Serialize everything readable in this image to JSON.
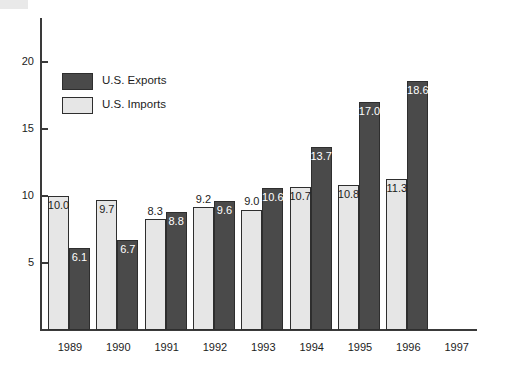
{
  "chart_data": {
    "type": "bar",
    "title": "",
    "subtitle": "",
    "xlabel": "",
    "ylabel": "",
    "categories": [
      "1989",
      "1990",
      "1991",
      "1992",
      "1993",
      "1994",
      "1995",
      "1996",
      "1997"
    ],
    "series": [
      {
        "name": "U.S. Imports",
        "color": "#e6e6e6",
        "values": [
          10.0,
          9.7,
          8.3,
          9.2,
          9.0,
          10.7,
          10.8,
          11.3,
          null
        ],
        "labels": [
          "10.0",
          "9.7",
          "8.3",
          "9.2",
          "9.0",
          "10.7",
          "10.8",
          "11.3",
          ""
        ]
      },
      {
        "name": "U.S. Exports",
        "color": "#4a4a4a",
        "values": [
          6.1,
          6.7,
          8.8,
          9.6,
          10.6,
          13.7,
          17.0,
          18.6,
          null
        ],
        "labels": [
          "6.1",
          "6.7",
          "8.8",
          "9.6",
          "10.6",
          "13.7",
          "17.0",
          "18.6",
          ""
        ]
      }
    ],
    "yticks": [
      5,
      10,
      15,
      20
    ],
    "ytick_labels": [
      "5",
      "10",
      "15",
      "20"
    ],
    "ylim": [
      0,
      23.3
    ],
    "grid": false,
    "legend_position": "upper-left"
  },
  "legend": {
    "items": [
      {
        "label": "U.S. Exports",
        "swatch": "exports"
      },
      {
        "label": "U.S. Imports",
        "swatch": "imports"
      }
    ]
  },
  "axis": {
    "y_tick_labels": [
      "20",
      "15",
      "10",
      "5"
    ]
  }
}
